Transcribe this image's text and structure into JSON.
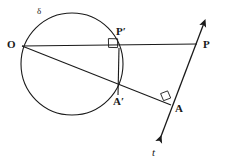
{
  "figure": {
    "type": "geometry-diagram",
    "background_color": "#ffffff",
    "stroke_color": "#1a1a1a",
    "labels": {
      "circle": "δ",
      "origin": "O",
      "p_prime": "P′",
      "p": "P",
      "a_prime": "A′",
      "a": "A",
      "line_t": "t"
    }
  },
  "geometry": {
    "circle": {
      "cx": 72,
      "cy": 64,
      "r": 51
    },
    "points": {
      "O": {
        "x": 22,
        "y": 46
      },
      "P_prime": {
        "x": 119,
        "y": 48
      },
      "P": {
        "x": 196,
        "y": 45
      },
      "A_prime": {
        "x": 118,
        "y": 95
      },
      "A": {
        "x": 169,
        "y": 108
      }
    },
    "segments": [
      {
        "name": "O-to-P",
        "x1": 22,
        "y1": 46,
        "x2": 197,
        "y2": 44
      },
      {
        "name": "O-to-A",
        "x1": 22,
        "y1": 46,
        "x2": 171,
        "y2": 105
      },
      {
        "name": "P-prime-to-A-prime",
        "x1": 119,
        "y1": 48,
        "x2": 118,
        "y2": 95
      }
    ],
    "line_t": {
      "x1": 157,
      "y1": 145,
      "x2": 206,
      "y2": 17
    },
    "right_angles": [
      {
        "name": "right-angle-at-P-prime",
        "x": 108,
        "y": 48,
        "size": 9
      },
      {
        "name": "right-angle-at-A",
        "x": 164,
        "y": 96,
        "size": 9
      }
    ],
    "label_positions": {
      "circle": {
        "x": 37,
        "y": 9
      },
      "origin": {
        "x": 8,
        "y": 40
      },
      "p_prime": {
        "x": 117,
        "y": 28
      },
      "p": {
        "x": 203,
        "y": 40
      },
      "a_prime": {
        "x": 114,
        "y": 97
      },
      "a": {
        "x": 175,
        "y": 104
      },
      "line_t": {
        "x": 152,
        "y": 148
      }
    }
  }
}
